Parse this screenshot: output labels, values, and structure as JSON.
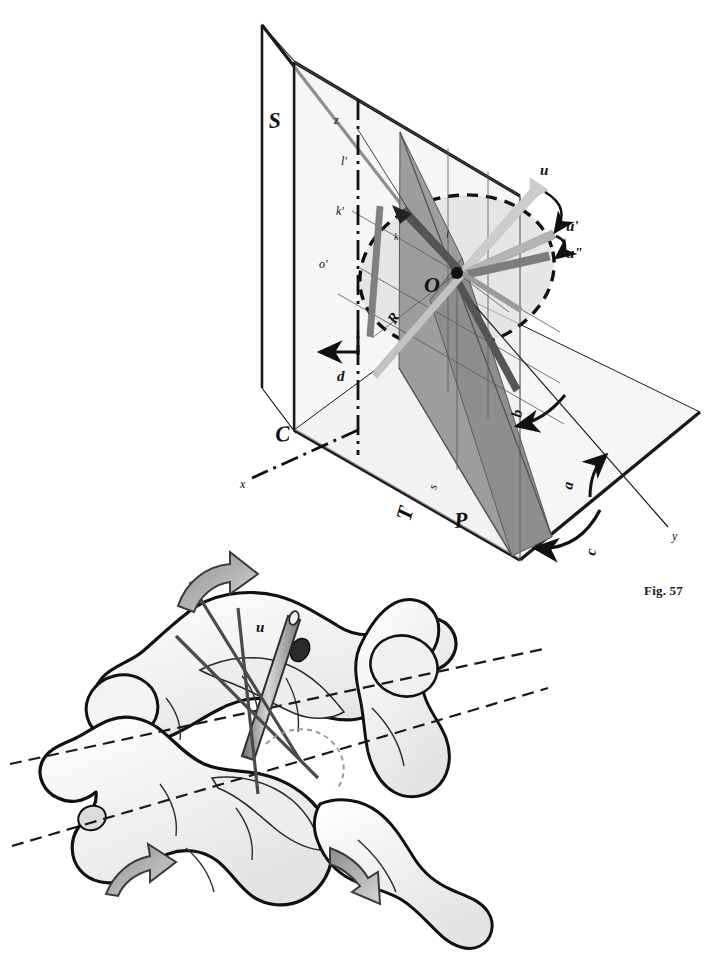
{
  "document": {
    "kind": "scientific-figure-plate",
    "background_color": "#ffffff",
    "width": 716,
    "height": 958
  },
  "figures": [
    {
      "id": "fig-57",
      "caption": "Fig. 57",
      "type": "geometric-3d-diagram",
      "description": "Three mutually perpendicular reference planes with a rotating vector and angular parameters",
      "planes": [
        {
          "name": "S",
          "label": "S",
          "role": "sagittal-plane",
          "fill": "#ffffff",
          "stroke": "#1a1a1a"
        },
        {
          "name": "C",
          "label": "C",
          "role": "coronal-plane",
          "fill": "#ededed",
          "stroke": "#1a1a1a"
        },
        {
          "name": "T",
          "label": "T",
          "role": "transverse-plane",
          "fill": "#ededed",
          "stroke": "#1a1a1a"
        },
        {
          "name": "P",
          "label": "P",
          "role": "oblique-pedicle-plane",
          "fill": "#9a9a9a",
          "stroke": "#4d4d4d"
        },
        {
          "name": "R",
          "label": "R",
          "role": "rotation-disc",
          "fill": "#e0e0e0",
          "stroke": "#111111"
        }
      ],
      "axes": [
        {
          "label": "x",
          "style": "dash-dot"
        },
        {
          "label": "y",
          "style": "solid"
        },
        {
          "label": "z",
          "style": "dash-dot"
        }
      ],
      "points": [
        {
          "label": "O",
          "role": "origin"
        },
        {
          "label": "o'",
          "role": "projected-origin"
        }
      ],
      "vectors": [
        {
          "label": "u",
          "color": "#c9c9c9",
          "role": "screw-axis-initial"
        },
        {
          "label": "u'",
          "color": "#b0b0b0",
          "role": "screw-axis-intermediate"
        },
        {
          "label": "u\"",
          "color": "#7a7a7a",
          "role": "screw-axis-final"
        },
        {
          "label": "k",
          "color": "#6e6e6e",
          "role": "trace-line-k"
        },
        {
          "label": "k'",
          "color": "#6e6e6e",
          "role": "trace-line-k-prime"
        },
        {
          "label": "l",
          "color": "#6e6e6e",
          "role": "trace-line-l"
        },
        {
          "label": "l'",
          "color": "#333333",
          "role": "trace-line-l-prime"
        }
      ],
      "angles": [
        {
          "label": "a",
          "role": "transverse-angle"
        },
        {
          "label": "b",
          "role": "sagittal-angle"
        },
        {
          "label": "c",
          "role": "plane-tilt-angle"
        },
        {
          "label": "d",
          "role": "coronal-angle"
        },
        {
          "label": "s",
          "role": "auxiliary-angle"
        }
      ],
      "labels": [
        "S",
        "C",
        "T",
        "P",
        "R",
        "O",
        "o'",
        "x",
        "y",
        "z",
        "u",
        "u'",
        "u\"",
        "k",
        "k'",
        "l",
        "l'",
        "a",
        "b",
        "c",
        "d",
        "s"
      ]
    },
    {
      "id": "fig-58",
      "caption": "Fig. 58",
      "type": "anatomical-illustration",
      "description": "Posterolateral view of cervical vertebrae with a transpedicular drill guide and rotation arrows",
      "labels": [
        "u"
      ],
      "annotations": [
        {
          "name": "screw-axis-label",
          "label": "u"
        },
        {
          "name": "upper-rotation-arrow",
          "label": ""
        },
        {
          "name": "lower-rotation-arrow",
          "label": ""
        },
        {
          "name": "right-rotation-arrow",
          "label": ""
        },
        {
          "name": "upper-reference-axis",
          "label": ""
        },
        {
          "name": "lower-reference-axis",
          "label": ""
        }
      ],
      "colors": {
        "bone_outline": "#111111",
        "bone_fill": "#ffffff",
        "bone_shadow": "#e6e6e6",
        "instrument": "#8f8f8f",
        "arrow_fill": "#a8a8a8"
      }
    }
  ]
}
